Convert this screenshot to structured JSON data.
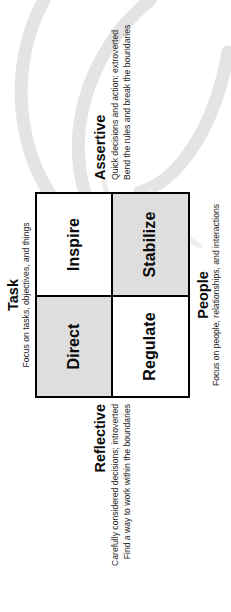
{
  "diagram": {
    "colors": {
      "shaded_quadrant": "#dedede",
      "plain_quadrant": "#ffffff",
      "border": "#000000",
      "watermark": "#e3e3e3",
      "text": "#0a0a0a"
    },
    "quadrants": [
      {
        "id": "direct",
        "label": "Direct",
        "shaded": true,
        "row": 1,
        "col": 1
      },
      {
        "id": "inspire",
        "label": "Inspire",
        "shaded": false,
        "row": 1,
        "col": 2
      },
      {
        "id": "regulate",
        "label": "Regulate",
        "shaded": false,
        "row": 2,
        "col": 1
      },
      {
        "id": "stabilize",
        "label": "Stabilize",
        "shaded": true,
        "row": 2,
        "col": 2
      }
    ],
    "axes": {
      "task": {
        "title": "Task",
        "sub_lines": [
          "Focus on tasks, objectives, and things"
        ]
      },
      "people": {
        "title": "People",
        "sub_lines": [
          "Focus on people, relationships, and interactions"
        ]
      },
      "assertive": {
        "title": "Assertive",
        "sub_lines": [
          "Quick decisions and action: extroverted",
          "Bend the rules and break the boundaries"
        ]
      },
      "reflective": {
        "title": "Reflective",
        "sub_lines": [
          "Carefully considered decisions; introverted",
          "Find a way to work within the boundaries"
        ]
      }
    },
    "decorations": [
      {
        "name": "swoosh-arrow-upper",
        "icon": "curved-arrow-icon"
      },
      {
        "name": "swoosh-arrow-middle",
        "icon": "curved-arrow-icon"
      },
      {
        "name": "swoosh-arrow-lower",
        "icon": "curved-arrow-icon"
      }
    ]
  }
}
